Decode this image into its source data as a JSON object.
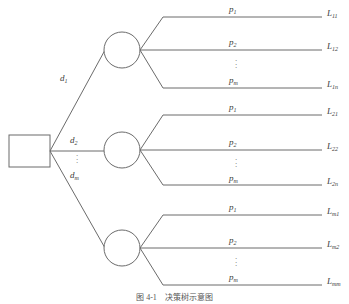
{
  "figure": {
    "type": "decision-tree-diagram",
    "caption": "图 4-1　决策树示意图",
    "root": {
      "shape": "rectangle",
      "label": ""
    },
    "stroke_color": "#6b6b6b",
    "text_color": "#3a3a3a",
    "background": "#ffffff",
    "vertical_ellipsis": "⋮",
    "decision_branches": [
      {
        "label": "d",
        "sub": "1"
      },
      {
        "label": "d",
        "sub": "2"
      },
      {
        "label": "d",
        "sub": "m"
      }
    ],
    "chance_nodes": [
      {
        "id": "node-1",
        "shape": "circle",
        "outcomes": [
          {
            "probability": "p",
            "probability_sub": "1",
            "payoff": "L",
            "payoff_sub": "11"
          },
          {
            "probability": "p",
            "probability_sub": "2",
            "payoff": "L",
            "payoff_sub": "12"
          },
          {
            "probability": "p",
            "probability_sub": "m",
            "payoff": "L",
            "payoff_sub": "1n"
          }
        ]
      },
      {
        "id": "node-2",
        "shape": "circle",
        "outcomes": [
          {
            "probability": "p",
            "probability_sub": "1",
            "payoff": "L",
            "payoff_sub": "21"
          },
          {
            "probability": "p",
            "probability_sub": "2",
            "payoff": "L",
            "payoff_sub": "22"
          },
          {
            "probability": "p",
            "probability_sub": "m",
            "payoff": "L",
            "payoff_sub": "2n"
          }
        ]
      },
      {
        "id": "node-3",
        "shape": "circle",
        "outcomes": [
          {
            "probability": "p",
            "probability_sub": "1",
            "payoff": "L",
            "payoff_sub": "m1"
          },
          {
            "probability": "p",
            "probability_sub": "2",
            "payoff": "L",
            "payoff_sub": "m2"
          },
          {
            "probability": "p",
            "probability_sub": "m",
            "payoff": "L",
            "payoff_sub": "mm"
          }
        ]
      }
    ]
  }
}
